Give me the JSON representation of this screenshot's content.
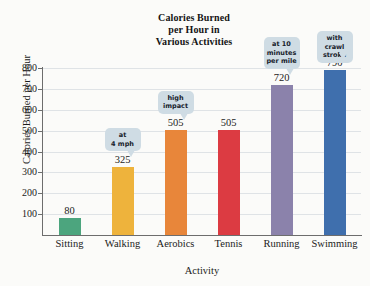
{
  "chart_data": {
    "type": "bar",
    "title": "Calories Burned per Hour in Various Activities",
    "title_lines": [
      "Calories Burned",
      "per Hour in",
      "Various Activities"
    ],
    "xlabel": "Activity",
    "ylabel": "Calories Burned per Hour",
    "categories": [
      "Sitting",
      "Walking",
      "Aerobics",
      "Tennis",
      "Running",
      "Swimming"
    ],
    "values": [
      80,
      325,
      505,
      505,
      720,
      790
    ],
    "value_labels": [
      "80",
      "325",
      "505",
      "505",
      "720",
      "790"
    ],
    "bar_colors": [
      "#4ca57e",
      "#eeb33c",
      "#e8863a",
      "#dc3b42",
      "#8b82ab",
      "#3f6fad"
    ],
    "ylim": [
      0,
      800
    ],
    "ytick_labels": [
      "100",
      "200",
      "300",
      "400",
      "500",
      "600",
      "700",
      "800"
    ],
    "ytick_values": [
      100,
      200,
      300,
      400,
      500,
      600,
      700,
      800
    ],
    "grid": true,
    "legend": false,
    "annotations": [
      {
        "category": "Walking",
        "lines": [
          "at",
          "4 mph"
        ],
        "text": "at 4 mph"
      },
      {
        "category": "Aerobics",
        "lines": [
          "high",
          "impact"
        ],
        "text": "high impact"
      },
      {
        "category": "Running",
        "lines": [
          "at 10",
          "minutes",
          "per mile"
        ],
        "text": "at 10 minutes per mile"
      },
      {
        "category": "Swimming",
        "lines": [
          "with crawl",
          "stroke"
        ],
        "text": "with crawl stroke"
      }
    ]
  }
}
